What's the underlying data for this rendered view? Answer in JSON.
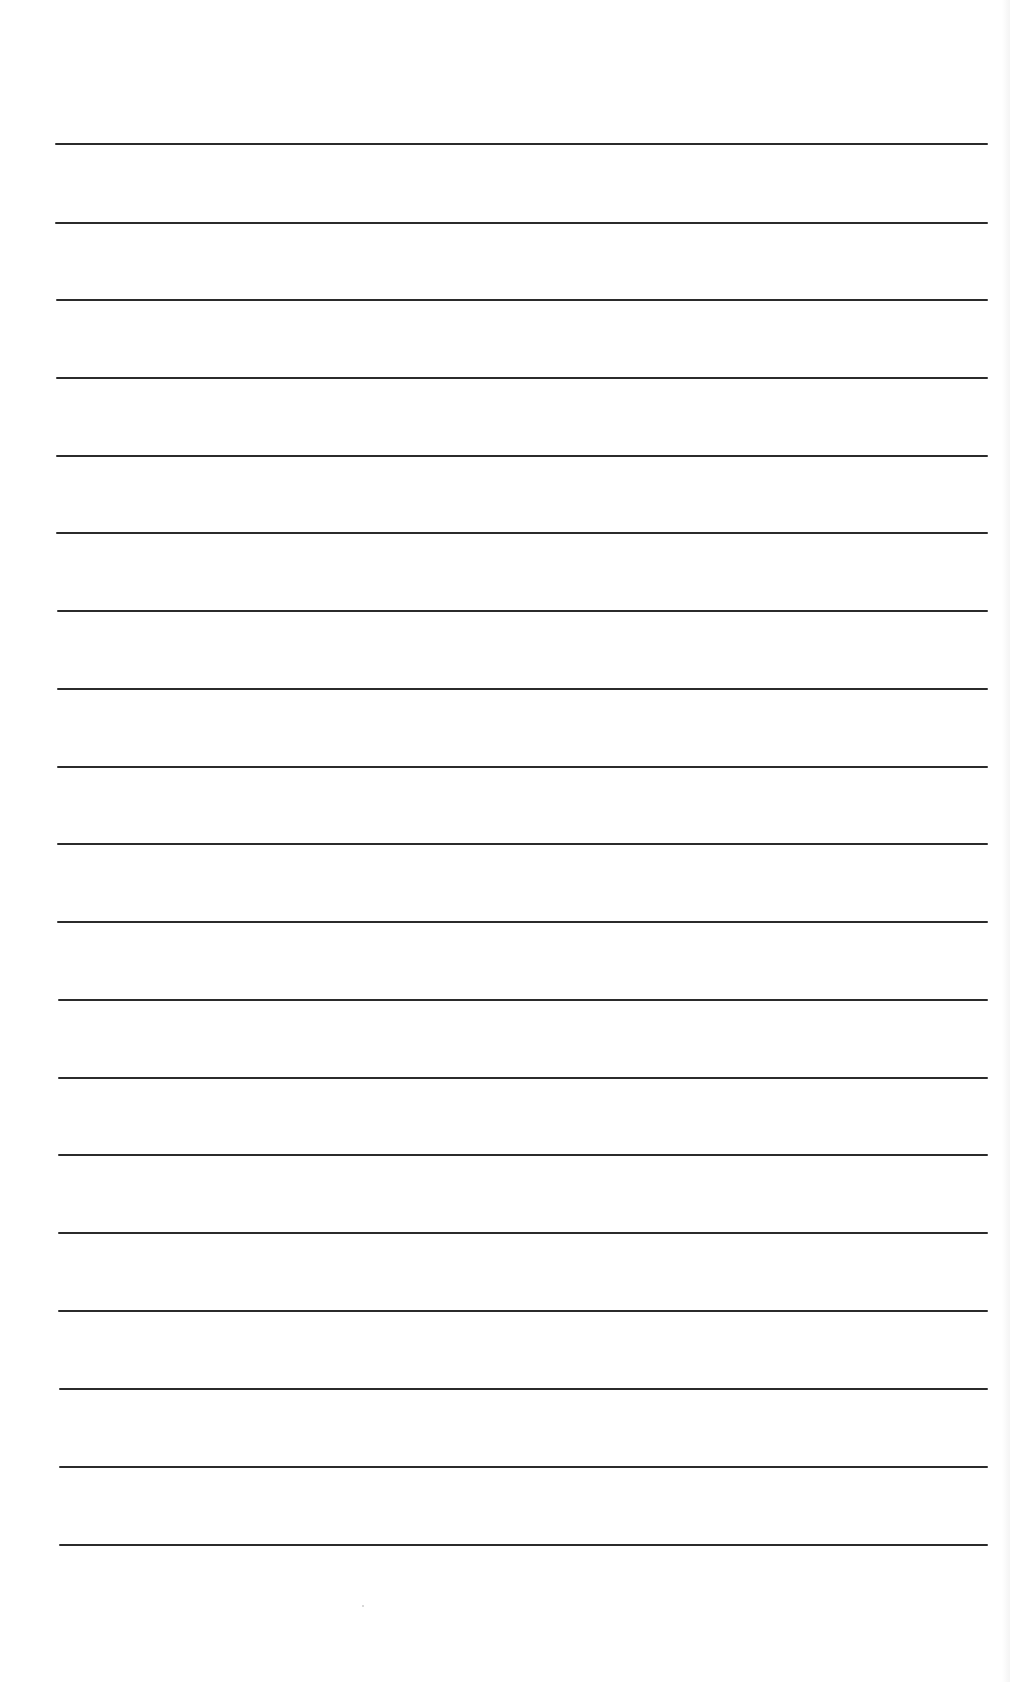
{
  "document": {
    "type": "ruled-sheet",
    "line_count": 19,
    "line_color": "#2b2b2b",
    "background_color": "#ffffff",
    "lines": [
      {
        "y": 143,
        "x1": 55,
        "x2": 988
      },
      {
        "y": 222,
        "x1": 55,
        "x2": 988
      },
      {
        "y": 299,
        "x1": 56,
        "x2": 988
      },
      {
        "y": 377,
        "x1": 56,
        "x2": 988
      },
      {
        "y": 455,
        "x1": 56,
        "x2": 988
      },
      {
        "y": 532,
        "x1": 56,
        "x2": 988
      },
      {
        "y": 610,
        "x1": 57,
        "x2": 988
      },
      {
        "y": 688,
        "x1": 57,
        "x2": 988
      },
      {
        "y": 766,
        "x1": 57,
        "x2": 988
      },
      {
        "y": 843,
        "x1": 57,
        "x2": 988
      },
      {
        "y": 921,
        "x1": 57,
        "x2": 988
      },
      {
        "y": 999,
        "x1": 58,
        "x2": 988
      },
      {
        "y": 1077,
        "x1": 58,
        "x2": 988
      },
      {
        "y": 1154,
        "x1": 58,
        "x2": 988
      },
      {
        "y": 1232,
        "x1": 58,
        "x2": 988
      },
      {
        "y": 1310,
        "x1": 58,
        "x2": 988
      },
      {
        "y": 1388,
        "x1": 59,
        "x2": 988
      },
      {
        "y": 1466,
        "x1": 59,
        "x2": 988
      },
      {
        "y": 1544,
        "x1": 59,
        "x2": 988
      }
    ]
  }
}
